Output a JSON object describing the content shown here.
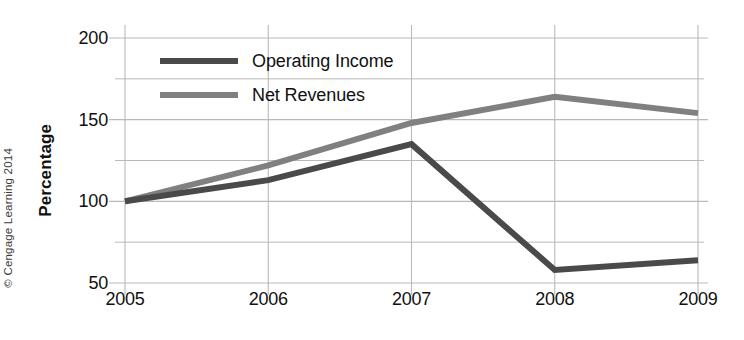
{
  "chart_data": {
    "type": "line",
    "title": "",
    "xlabel": "",
    "ylabel": "Percentage",
    "x": [
      "2005",
      "2006",
      "2007",
      "2008",
      "2009"
    ],
    "categories": [
      "2005",
      "2006",
      "2007",
      "2008",
      "2009"
    ],
    "series": [
      {
        "name": "Operating Income",
        "color": "#4a4a4a",
        "values": [
          100,
          113,
          135,
          58,
          64
        ]
      },
      {
        "name": "Net Revenues",
        "color": "#808080",
        "values": [
          100,
          122,
          148,
          164,
          154
        ]
      }
    ],
    "ylim": [
      50,
      200
    ],
    "xlim": [
      "2005",
      "2009"
    ],
    "y_ticks_major": [
      50,
      100,
      150,
      200
    ],
    "y_ticks_minor": [
      75,
      125,
      175
    ],
    "y_tick_labels": [
      "50",
      "100",
      "150",
      "200"
    ],
    "grid": true,
    "grid_axis": "both",
    "legend_position": "upper-left-inside"
  },
  "axes": {
    "y_title": "Percentage",
    "y_labels": [
      {
        "value": 200,
        "text": "200"
      },
      {
        "value": 150,
        "text": "150"
      },
      {
        "value": 100,
        "text": "100"
      },
      {
        "value": 50,
        "text": "50"
      }
    ],
    "x_labels": [
      {
        "value": "2005",
        "text": "2005"
      },
      {
        "value": "2006",
        "text": "2006"
      },
      {
        "value": "2007",
        "text": "2007"
      },
      {
        "value": "2008",
        "text": "2008"
      },
      {
        "value": "2009",
        "text": "2009"
      }
    ]
  },
  "legend": {
    "items": [
      {
        "label": "Operating Income",
        "color": "#4a4a4a"
      },
      {
        "label": "Net Revenues",
        "color": "#808080"
      }
    ]
  },
  "credit": {
    "text": "© Cengage Learning 2014"
  },
  "colors": {
    "background": "#ffffff",
    "grid": "#b9b9b9",
    "text": "#111111",
    "operating_income": "#4a4a4a",
    "net_revenues": "#808080"
  }
}
